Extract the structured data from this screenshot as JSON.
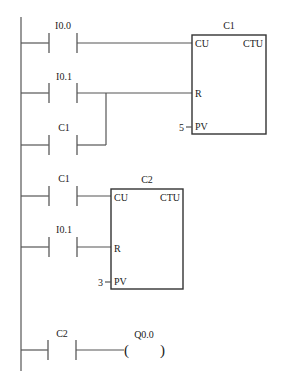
{
  "diagram": {
    "type": "ladder-logic",
    "rungs": [
      {
        "id": 1,
        "contacts": [
          {
            "label": "I0.0",
            "type": "NO"
          }
        ],
        "target": "C1.CU"
      },
      {
        "id": 2,
        "contacts": [
          {
            "label": "I0.1",
            "type": "NO"
          }
        ],
        "parallel": [
          {
            "label": "C1",
            "type": "NO"
          }
        ],
        "target": "C1.R"
      },
      {
        "id": 3,
        "contacts": [
          {
            "label": "C1",
            "type": "NO"
          }
        ],
        "target": "C2.CU"
      },
      {
        "id": 4,
        "contacts": [
          {
            "label": "I0.1",
            "type": "NO"
          }
        ],
        "target": "C2.R"
      },
      {
        "id": 5,
        "contacts": [
          {
            "label": "C2",
            "type": "NO"
          }
        ],
        "coil": {
          "label": "Q0.0"
        }
      }
    ],
    "counters": [
      {
        "name": "C1",
        "type": "CTU",
        "pins": {
          "cu": "CU",
          "r": "R",
          "pv": "PV"
        },
        "preset": "5"
      },
      {
        "name": "C2",
        "type": "CTU",
        "pins": {
          "cu": "CU",
          "r": "R",
          "pv": "PV"
        },
        "preset": "3"
      }
    ]
  },
  "labels": {
    "rung1_contact": "I0.0",
    "rung2_contact": "I0.1",
    "rung2_parallel": "C1",
    "rung3_contact": "C1",
    "rung4_contact": "I0.1",
    "rung5_contact": "C2",
    "rung5_coil": "Q0.0",
    "c1_name": "C1",
    "c1_type": "CTU",
    "c1_cu": "CU",
    "c1_r": "R",
    "c1_pv": "PV",
    "c1_preset": "5",
    "c2_name": "C2",
    "c2_type": "CTU",
    "c2_cu": "CU",
    "c2_r": "R",
    "c2_pv": "PV",
    "c2_preset": "3",
    "coil_open": "(",
    "coil_close": ")"
  },
  "colors": {
    "wire": "#555555",
    "box": "#333333",
    "text": "#222222",
    "background": "#ffffff"
  }
}
